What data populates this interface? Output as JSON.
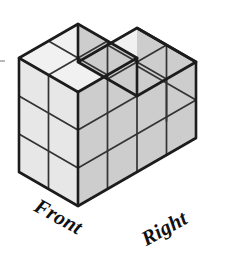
{
  "figure": {
    "kind": "isometric-unit-cube-solid",
    "labels": {
      "front": "Front",
      "right": "Right"
    },
    "colors": {
      "background": "#ffffff",
      "top_face": "#f1f1f1",
      "left_face": "#e7e7e7",
      "right_face": "#cdcdcd",
      "outline": "#1c1c1c",
      "inner_line": "#333333"
    },
    "geometry": {
      "origin_x": 19,
      "origin_y": 172,
      "half_width": 29.5,
      "rise": 17,
      "cube_height": 38,
      "outline_width": 2.6,
      "inner_width": 1.7
    },
    "structure": {
      "footprint_columns": 4,
      "footprint_rows": 2,
      "heights_front_row": [
        3,
        3,
        2,
        2
      ],
      "heights_back_row": [
        3,
        3,
        2,
        2
      ],
      "total_cubes": 20
    },
    "faces": {
      "top": [
        {
          "name": "top-back-left-col0",
          "cx": 0,
          "cy": 0,
          "z": 3
        },
        {
          "name": "top-back-left-col1",
          "cx": 1,
          "cy": 0,
          "z": 3
        },
        {
          "name": "top-front-left-col0",
          "cx": 0,
          "cy": 1,
          "z": 3
        },
        {
          "name": "top-front-left-col1",
          "cx": 1,
          "cy": 1,
          "z": 3
        },
        {
          "name": "top-back-right-col2",
          "cx": 2,
          "cy": 0,
          "z": 2
        },
        {
          "name": "top-back-right-col3",
          "cx": 3,
          "cy": 0,
          "z": 2
        },
        {
          "name": "top-front-right-col2",
          "cx": 2,
          "cy": 1,
          "z": 2
        },
        {
          "name": "top-front-right-col3",
          "cx": 3,
          "cy": 1,
          "z": 2
        }
      ],
      "left": [
        {
          "name": "left-face-row0-lvl0",
          "cy": 0,
          "z": 0
        },
        {
          "name": "left-face-row0-lvl1",
          "cy": 0,
          "z": 1
        },
        {
          "name": "left-face-row0-lvl2",
          "cy": 0,
          "z": 2
        },
        {
          "name": "left-face-row1-lvl0",
          "cy": 1,
          "z": 0
        },
        {
          "name": "left-face-row1-lvl1",
          "cy": 1,
          "z": 1
        },
        {
          "name": "left-face-row1-lvl2",
          "cy": 1,
          "z": 2
        }
      ],
      "right": [
        {
          "name": "right-face-col0-lvl0",
          "cx": 0,
          "z": 0
        },
        {
          "name": "right-face-col0-lvl1",
          "cx": 0,
          "z": 1
        },
        {
          "name": "right-face-col0-lvl2",
          "cx": 0,
          "z": 2
        },
        {
          "name": "right-face-col1-lvl0",
          "cx": 1,
          "z": 0
        },
        {
          "name": "right-face-col1-lvl1",
          "cx": 1,
          "z": 1
        },
        {
          "name": "right-face-col1-lvl2",
          "cx": 1,
          "z": 2
        },
        {
          "name": "right-face-col2-lvl0",
          "cx": 2,
          "z": 0
        },
        {
          "name": "right-face-col2-lvl1",
          "cx": 2,
          "z": 1
        },
        {
          "name": "right-face-col3-lvl0",
          "cx": 3,
          "z": 0
        },
        {
          "name": "right-face-col3-lvl1",
          "cx": 3,
          "z": 1
        }
      ]
    }
  }
}
